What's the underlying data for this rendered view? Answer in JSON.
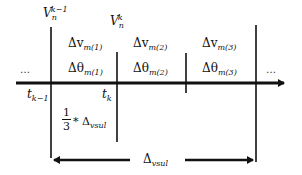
{
  "diagram": {
    "type": "timeline",
    "colors": {
      "line": "#111111",
      "background": "#ffffff"
    },
    "node_labels": {
      "v_prev": {
        "base": "V",
        "sub": "n",
        "sup": "k−1"
      },
      "v_curr": {
        "base": "V",
        "sub": "n",
        "sup": "k"
      }
    },
    "time_labels": {
      "t_prev": {
        "base": "t",
        "sub": "k−1"
      },
      "t_curr": {
        "base": "t",
        "sub": "k"
      }
    },
    "intervals": [
      {
        "dv": "Δv",
        "dv_sub": "m(1)",
        "dtheta": "Δθ",
        "dtheta_sub": "m(1)"
      },
      {
        "dv": "Δv",
        "dv_sub": "m(2)",
        "dtheta": "Δθ",
        "dtheta_sub": "m(2)"
      },
      {
        "dv": "Δv",
        "dv_sub": "m(3)",
        "dtheta": "Δθ",
        "dtheta_sub": "m(3)"
      }
    ],
    "ellipsis_left": "…",
    "ellipsis_right": "…",
    "fraction": {
      "numerator": "1",
      "denominator": "3",
      "operator": "*",
      "symbol": "Δ",
      "symbol_sub": "vsul"
    },
    "span_label": {
      "symbol": "Δ",
      "sub": "vsul"
    }
  }
}
